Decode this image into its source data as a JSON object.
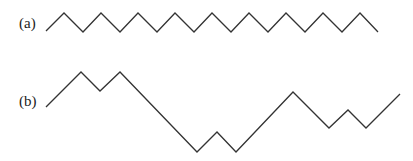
{
  "diagram": {
    "type": "path-comparison",
    "stroke_color": "#333333",
    "panels": [
      {
        "id": "a",
        "label": "(a)",
        "description": "Regular zigzag path with equal up/down steps",
        "points": [
          [
            46,
            31
          ],
          [
            64,
            13
          ],
          [
            83,
            32
          ],
          [
            101,
            13
          ],
          [
            120,
            32
          ],
          [
            138,
            13
          ],
          [
            157,
            32
          ],
          [
            175,
            13
          ],
          [
            194,
            32
          ],
          [
            212,
            13
          ],
          [
            231,
            32
          ],
          [
            249,
            13
          ],
          [
            268,
            32
          ],
          [
            286,
            13
          ],
          [
            305,
            32
          ],
          [
            323,
            13
          ],
          [
            342,
            32
          ],
          [
            360,
            13
          ],
          [
            378,
            32
          ]
        ]
      },
      {
        "id": "b",
        "label": "(b)",
        "description": "Irregular path with varying rises and descents",
        "points": [
          [
            46,
            107
          ],
          [
            81,
            72
          ],
          [
            100,
            91
          ],
          [
            120,
            72
          ],
          [
            197,
            152
          ],
          [
            217,
            132
          ],
          [
            236,
            152
          ],
          [
            293,
            92
          ],
          [
            329,
            128
          ],
          [
            348,
            110
          ],
          [
            366,
            128
          ],
          [
            400,
            94
          ]
        ]
      }
    ]
  }
}
